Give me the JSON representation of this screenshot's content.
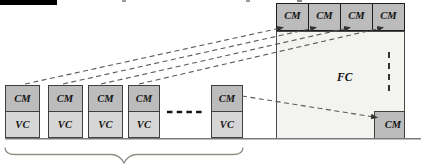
{
  "stacks": [
    {
      "cm": "CM",
      "vc": "VC"
    },
    {
      "cm": "CM",
      "vc": "VC"
    },
    {
      "cm": "CM",
      "vc": "VC"
    },
    {
      "cm": "CM",
      "vc": "VC"
    },
    {
      "cm": "CM",
      "vc": "VC"
    }
  ],
  "top_row": [
    "CM",
    "CM",
    "CM",
    "CM"
  ],
  "fc": {
    "label": "FC",
    "corner_cm": "CM"
  },
  "colors": {
    "cm_fill": "#bcbcbc",
    "vc_fill": "#d6d6d6",
    "fc_fill": "#f3f3ef",
    "box_border": "#3f3f3f",
    "dashed_line": "#5a5a5a",
    "ground_line": "#7a7a7a",
    "brace": "#8f8f85",
    "top_bar": "#000000"
  }
}
